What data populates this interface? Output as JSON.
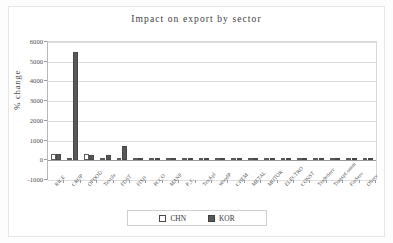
{
  "chart_data": {
    "type": "bar",
    "title": "Impact on export by sector",
    "xlabel": "",
    "ylabel": "% change",
    "ylim": [
      -1000,
      6000
    ],
    "yticks": [
      6000,
      5000,
      4000,
      3000,
      2000,
      1000,
      0,
      -1000
    ],
    "ytick_labels": [
      "6000",
      "5000",
      "4000",
      "3000",
      "2000",
      "1000",
      "0",
      "-1000"
    ],
    "grid": true,
    "legend_position": "bottom",
    "categories": [
      "RICE",
      "CROP",
      "OFOOD",
      "Textile",
      "FDST",
      "FISH",
      "PCCO",
      "MANF",
      "P_C",
      "TexApl",
      "WoodP",
      "CHEM",
      "METAL",
      "MOTOR",
      "ELECTRO",
      "CONST",
      "TradeServ",
      "TranspComm",
      "FinServ",
      "OServ"
    ],
    "series": [
      {
        "name": "CHN",
        "color": "#ffffff",
        "values": [
          330,
          0,
          300,
          0,
          10,
          5,
          5,
          5,
          0,
          5,
          5,
          0,
          0,
          0,
          5,
          0,
          5,
          5,
          5,
          5
        ]
      },
      {
        "name": "KOR",
        "color": "#585858",
        "values": [
          330,
          5500,
          260,
          250,
          720,
          20,
          20,
          25,
          0,
          25,
          25,
          0,
          0,
          0,
          25,
          0,
          25,
          25,
          25,
          25
        ]
      }
    ]
  },
  "legend": {
    "items": [
      {
        "label": "CHN",
        "swatch": "hollow-square"
      },
      {
        "label": "KOR",
        "swatch": "filled-square"
      }
    ]
  }
}
